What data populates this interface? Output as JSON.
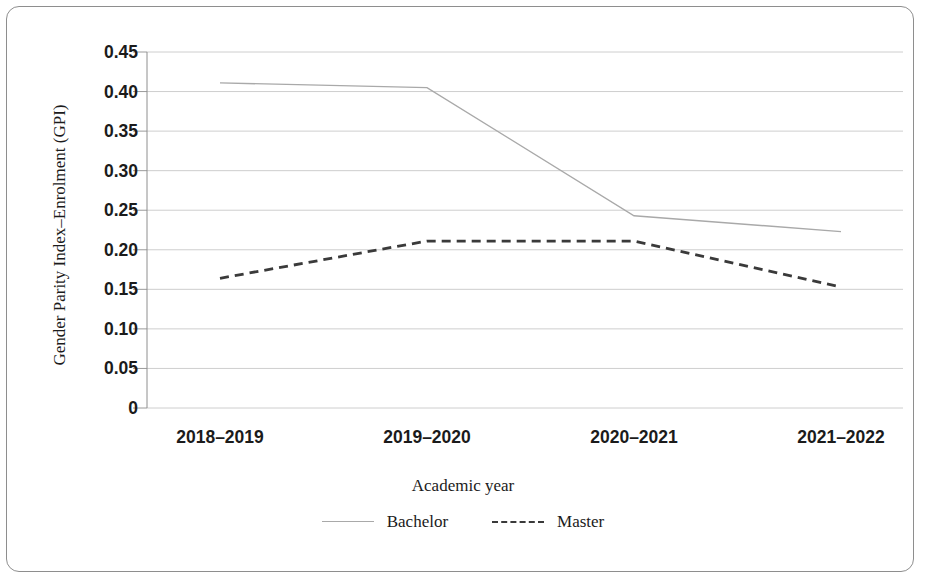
{
  "chart_data": {
    "type": "line",
    "title": "",
    "xlabel": "Academic year",
    "ylabel": "Gender Parity Index–Enrolment (GPI)",
    "categories": [
      "2018–2019",
      "2019–2020",
      "2020–2021",
      "2021–2022"
    ],
    "series": [
      {
        "name": "Bachelor",
        "values": [
          0.411,
          0.405,
          0.243,
          0.223
        ],
        "style": "solid",
        "color": "#a9a9a9"
      },
      {
        "name": "Master",
        "values": [
          0.164,
          0.211,
          0.211,
          0.153
        ],
        "style": "dashed",
        "color": "#3a3a3a"
      }
    ],
    "ylim": [
      0,
      0.45
    ],
    "ytick_labels": [
      "0",
      "0.05",
      "0.10",
      "0.15",
      "0.20",
      "0.25",
      "0.30",
      "0.35",
      "0.40",
      "0.45"
    ],
    "ytick_values": [
      0,
      0.05,
      0.1,
      0.15,
      0.2,
      0.25,
      0.3,
      0.35,
      0.4,
      0.45
    ],
    "grid": "horizontal",
    "legend_position": "bottom",
    "gridline_color": "#c8c8c8",
    "axis_color": "#8e8e8e",
    "frame_color": "#8e8e8e",
    "background": "#ffffff"
  },
  "legend": {
    "items": [
      {
        "label": "Bachelor"
      },
      {
        "label": "Master"
      }
    ]
  }
}
